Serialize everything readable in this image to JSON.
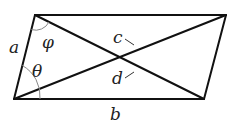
{
  "diagram": {
    "title": "",
    "shape": "parallelogram",
    "labels": {
      "side_left": "a",
      "side_bottom": "b",
      "diagonal_upper": "c",
      "diagonal_lower": "d",
      "angle_top": "φ",
      "angle_bottom": "θ"
    },
    "colors": {
      "line": "#111111",
      "arc": "#888888",
      "text": "#222222"
    }
  }
}
